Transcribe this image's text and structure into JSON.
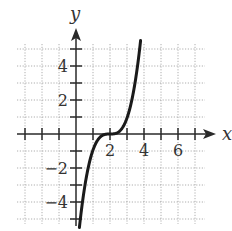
{
  "chart_data": {
    "type": "line",
    "title": "",
    "xlabel": "x",
    "ylabel": "y",
    "function": "y = (x - 2)^3",
    "xlim": [
      -3,
      7
    ],
    "ylim": [
      -5,
      5
    ],
    "grid": true,
    "grid_step": 1,
    "x_tick_labels": [
      {
        "value": 2,
        "label": "2"
      },
      {
        "value": 4,
        "label": "4"
      },
      {
        "value": 6,
        "label": "6"
      }
    ],
    "y_tick_labels": [
      {
        "value": 4,
        "label": "4"
      },
      {
        "value": 2,
        "label": "2"
      },
      {
        "value": -2,
        "label": "−2"
      },
      {
        "value": -4,
        "label": "−4"
      }
    ],
    "series": [
      {
        "name": "curve",
        "x": [
          0.2,
          0.5,
          1.0,
          1.5,
          2.0,
          2.5,
          3.0,
          3.5,
          3.8
        ],
        "y": [
          -5.5,
          -3.4,
          -1.0,
          -0.1,
          0.0,
          0.1,
          1.0,
          3.4,
          5.5
        ]
      }
    ],
    "colors": {
      "curve": "#1a1a1a",
      "axes": "#2a2a2a",
      "grid": "#9a9a9a"
    }
  }
}
